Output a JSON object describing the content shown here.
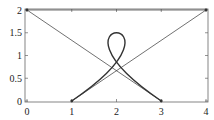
{
  "chart_data": {
    "type": "line",
    "title": "",
    "xlabel": "",
    "ylabel": "",
    "xlim": [
      0,
      4
    ],
    "ylim": [
      0,
      2
    ],
    "x_ticks": [
      0,
      1,
      2,
      3,
      4
    ],
    "x_tick_labels": [
      "0",
      "1",
      "2",
      "3",
      "4"
    ],
    "y_ticks": [
      0,
      0.5,
      1,
      1.5,
      2
    ],
    "y_tick_labels": [
      "0",
      "0.5",
      "1",
      "1.5",
      "2"
    ],
    "grid": false,
    "frame": true,
    "series": [
      {
        "name": "control-polygon",
        "style": "thin",
        "points": [
          [
            1,
            0
          ],
          [
            4,
            2
          ],
          [
            0,
            2
          ],
          [
            3,
            0
          ]
        ]
      },
      {
        "name": "bezier-curve",
        "style": "thick",
        "kind": "cubic-bezier",
        "control_points": [
          [
            1,
            0
          ],
          [
            4,
            2
          ],
          [
            0,
            2
          ],
          [
            3,
            0
          ]
        ],
        "notable_points": {
          "start": [
            1,
            0
          ],
          "midpoint": [
            2,
            1.5
          ],
          "end": [
            3,
            0
          ]
        }
      }
    ],
    "marked_points": [
      [
        1,
        0
      ],
      [
        4,
        2
      ],
      [
        0,
        2
      ],
      [
        3,
        0
      ]
    ],
    "colors": {
      "line": "#333333",
      "frame": "#666666",
      "text": "#222222"
    }
  }
}
